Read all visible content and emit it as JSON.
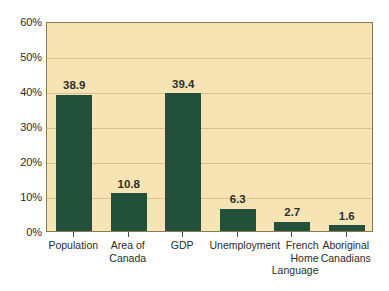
{
  "chart_data": {
    "type": "bar",
    "title": "",
    "subtitle": "",
    "xlabel": "",
    "ylabel": "",
    "ylim": [
      0,
      60
    ],
    "y_tick_labels": [
      "0%",
      "10%",
      "20%",
      "30%",
      "40%",
      "50%",
      "60%"
    ],
    "y_tick_values": [
      0,
      10,
      20,
      30,
      40,
      50,
      60
    ],
    "grid": true,
    "legend": "none",
    "categories": [
      "Population",
      "Area of\nCanada",
      "GDP",
      "Unemployment",
      "French\nHome\nLanguage",
      "Aboriginal\nCanadians"
    ],
    "values": [
      38.9,
      10.8,
      39.4,
      6.3,
      2.7,
      1.6
    ],
    "value_labels": [
      "38.9",
      "10.8",
      "39.4",
      "6.3",
      "2.7",
      "1.6"
    ],
    "colors": {
      "bar": "#23503a",
      "plot_background": "#f6e4b4",
      "gridline": "#d9c48c",
      "axis_border": "#8a7a52",
      "text": "#2b2b2b",
      "page_background": "#ffffff"
    }
  }
}
